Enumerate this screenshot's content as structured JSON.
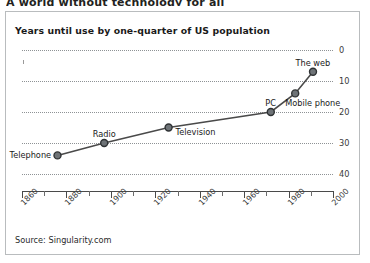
{
  "page": {
    "cut_headline": "A world without technology for all",
    "source_note": "Source: Singularity.com"
  },
  "chart_data": {
    "type": "line",
    "title": "Years until use by one-quarter of US population",
    "xlabel": "",
    "ylabel": "",
    "xlim": [
      1860,
      2000
    ],
    "ylim": [
      0,
      40
    ],
    "y_inverted": true,
    "grid": true,
    "legend": "none",
    "xticks_major": [
      "1860",
      "1880",
      "1900",
      "1920",
      "1940",
      "1960",
      "1980",
      "2000"
    ],
    "xticks_minor": [
      "1870",
      "1890",
      "1910",
      "1930",
      "1950",
      "1970",
      "1990"
    ],
    "yticks": [
      "0",
      "10",
      "20",
      "30",
      "40"
    ],
    "points": [
      {
        "label": "Telephone",
        "x": 1876,
        "y": 34,
        "label_side": "left"
      },
      {
        "label": "Radio",
        "x": 1897,
        "y": 30,
        "label_side": "above"
      },
      {
        "label": "Television",
        "x": 1926,
        "y": 25,
        "label_side": "right"
      },
      {
        "label": "PC",
        "x": 1972,
        "y": 20,
        "label_side": "above"
      },
      {
        "label": "Mobile phone",
        "x": 1983,
        "y": 14,
        "label_side": "below"
      },
      {
        "label": "The web",
        "x": 1991,
        "y": 7,
        "label_side": "above"
      }
    ],
    "colors": {
      "line": "#4a4a4a",
      "marker_fill": "#6e7377",
      "marker_edge": "#2f3234",
      "grid": "#8e9295",
      "axis": "#4a4a4a",
      "text": "#1a1a1a"
    }
  }
}
